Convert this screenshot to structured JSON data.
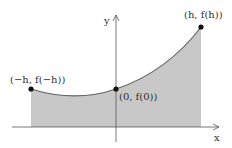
{
  "diagram": {
    "axes": {
      "x_label": "x",
      "y_label": "y"
    },
    "points": [
      {
        "id": "left",
        "label": "(−h, f(−h))"
      },
      {
        "id": "middle",
        "label": "(0, f(0))"
      },
      {
        "id": "right",
        "label": "(h, f(h))"
      }
    ],
    "colors": {
      "fill": "#c8c8c8",
      "curve": "#666666",
      "axis": "#555555",
      "point": "#111111"
    }
  }
}
